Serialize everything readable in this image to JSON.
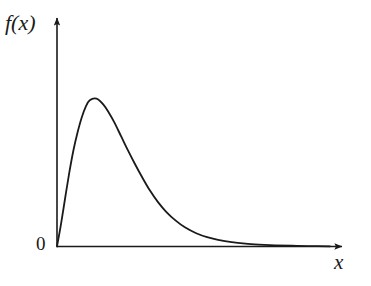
{
  "figure": {
    "background_color": "#ffffff",
    "ink_color": "#1a1a1a",
    "width": 371,
    "height": 286
  },
  "labels": {
    "ylabel": "f(x)",
    "xlabel": "x",
    "origin": "0"
  },
  "chart_data": {
    "type": "line",
    "title": "",
    "subtitle": "",
    "xlabel": "x",
    "ylabel": "f(x)",
    "legend": [],
    "legend_position": "none",
    "grid": false,
    "xlim": [
      0,
      10
    ],
    "ylim": [
      0,
      1.12
    ],
    "xticks": [],
    "yticks": [],
    "xticklabels": [],
    "yticklabels": [],
    "axis_style": "arrowed-open-axes",
    "annotations": [
      {
        "text": "0",
        "x": 0,
        "y": 0,
        "note": "origin marker at axis intersection"
      }
    ],
    "series": [
      {
        "name": "f(x)",
        "color": "#1a1a1a",
        "linewidth": 1.8,
        "x": [
          0.0,
          0.15,
          0.3,
          0.45,
          0.6,
          0.75,
          0.9,
          1.05,
          1.2,
          1.45,
          1.7,
          1.9,
          2.1,
          2.35,
          2.6,
          2.85,
          3.1,
          3.4,
          3.7,
          4.0,
          4.35,
          4.7,
          5.1,
          5.5,
          5.9,
          6.4,
          6.9,
          7.4,
          8.0,
          8.6,
          9.2,
          10.0
        ],
        "y": [
          0.0,
          0.155,
          0.33,
          0.5,
          0.65,
          0.77,
          0.87,
          0.945,
          0.99,
          1.0,
          0.96,
          0.905,
          0.84,
          0.745,
          0.65,
          0.56,
          0.475,
          0.38,
          0.3,
          0.235,
          0.175,
          0.128,
          0.09,
          0.063,
          0.045,
          0.029,
          0.019,
          0.013,
          0.008,
          0.005,
          0.003,
          0.001
        ]
      }
    ],
    "peak": {
      "x": 1.45,
      "y": 1.0
    }
  }
}
